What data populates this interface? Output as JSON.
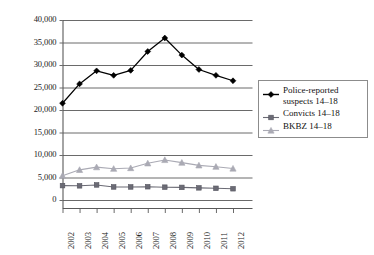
{
  "chart_data": {
    "type": "line",
    "title": "",
    "subtitle": "",
    "xlabel": "",
    "ylabel": "",
    "categories": [
      "2002",
      "2003",
      "2004",
      "2005",
      "2006",
      "2007",
      "2008",
      "2009",
      "2010",
      "2011",
      "2012"
    ],
    "ylim": [
      0,
      40000
    ],
    "ytick_labels": [
      "0",
      "5,000",
      "10,000",
      "15,000",
      "20,000",
      "25,000",
      "30,000",
      "35,000",
      "40,000"
    ],
    "ytick_values": [
      0,
      5000,
      10000,
      15000,
      20000,
      25000,
      30000,
      35000,
      40000
    ],
    "grid": true,
    "grid_color": "#595959",
    "legend_position": "right",
    "series": [
      {
        "name": "Police-reported suspects 14–18",
        "marker": "diamond",
        "color": "#000000",
        "values": [
          21500,
          25800,
          28700,
          27700,
          28800,
          33000,
          36000,
          32200,
          29000,
          27700,
          26500
        ]
      },
      {
        "name": "Convicts 14–18",
        "marker": "square",
        "color": "#6b6b75",
        "values": [
          3200,
          3150,
          3350,
          2900,
          2900,
          2950,
          2850,
          2800,
          2700,
          2600,
          2500
        ]
      },
      {
        "name": "BKBZ 14–18",
        "marker": "triangle",
        "color": "#aaaab4",
        "values": [
          5400,
          6700,
          7300,
          6950,
          7100,
          8150,
          8900,
          8300,
          7700,
          7400,
          7000
        ]
      }
    ]
  },
  "legend": {
    "items": [
      {
        "label": "Police-reported suspects 14–18",
        "marker": "diamond",
        "color": "#000000"
      },
      {
        "label": "Convicts 14–18",
        "marker": "square",
        "color": "#6b6b75"
      },
      {
        "label": "BKBZ 14–18",
        "marker": "triangle",
        "color": "#aaaab4"
      }
    ]
  }
}
